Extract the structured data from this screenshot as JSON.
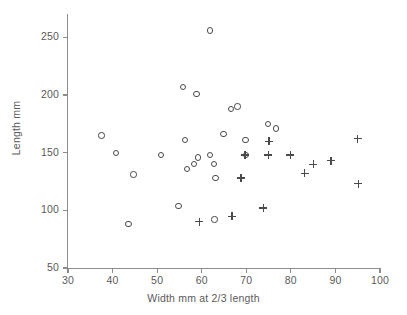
{
  "chart_data": {
    "type": "scatter",
    "title": "",
    "xlabel": "Width mm at 2/3 length",
    "ylabel": "Length mm",
    "xlim": [
      30,
      100
    ],
    "ylim": [
      50,
      270
    ],
    "xticks": [
      30,
      40,
      50,
      60,
      70,
      80,
      90,
      100
    ],
    "yticks": [
      50,
      100,
      150,
      200,
      250
    ],
    "xtick_labels": [
      "30",
      "40",
      "50",
      "60",
      "70",
      "80",
      "90",
      "100"
    ],
    "ytick_labels": [
      "50",
      "100",
      "150",
      "200",
      "250"
    ],
    "grid": false,
    "legend": false,
    "axis_color": "#8c8c8c",
    "marker_color": "#4a4a4a",
    "text_color": "#5a5a5a",
    "background": "#ffffff",
    "series": [
      {
        "name": "open-circle-group",
        "marker": "circle",
        "points": [
          {
            "x": 37.5,
            "y": 165
          },
          {
            "x": 40.7,
            "y": 150
          },
          {
            "x": 44.7,
            "y": 131
          },
          {
            "x": 43.6,
            "y": 88
          },
          {
            "x": 50.9,
            "y": 148
          },
          {
            "x": 54.8,
            "y": 104
          },
          {
            "x": 55.8,
            "y": 207
          },
          {
            "x": 56.2,
            "y": 161
          },
          {
            "x": 56.7,
            "y": 136
          },
          {
            "x": 58.3,
            "y": 140
          },
          {
            "x": 58.8,
            "y": 201
          },
          {
            "x": 59.1,
            "y": 146
          },
          {
            "x": 61.9,
            "y": 256
          },
          {
            "x": 61.8,
            "y": 148
          },
          {
            "x": 62.8,
            "y": 140
          },
          {
            "x": 62.9,
            "y": 92
          },
          {
            "x": 63.1,
            "y": 128
          },
          {
            "x": 64.9,
            "y": 166
          },
          {
            "x": 66.6,
            "y": 188
          },
          {
            "x": 68.0,
            "y": 190
          },
          {
            "x": 69.8,
            "y": 161
          },
          {
            "x": 70.0,
            "y": 148
          },
          {
            "x": 74.9,
            "y": 175
          },
          {
            "x": 76.7,
            "y": 171
          }
        ]
      },
      {
        "name": "plus-group",
        "marker": "plus",
        "points": [
          {
            "x": 59.5,
            "y": 90
          },
          {
            "x": 66.8,
            "y": 95
          },
          {
            "x": 68.8,
            "y": 128
          },
          {
            "x": 69.7,
            "y": 148
          },
          {
            "x": 73.8,
            "y": 102
          },
          {
            "x": 74.9,
            "y": 148
          },
          {
            "x": 75.1,
            "y": 160
          },
          {
            "x": 79.9,
            "y": 148
          },
          {
            "x": 83.1,
            "y": 132
          },
          {
            "x": 85.0,
            "y": 140
          },
          {
            "x": 89.0,
            "y": 143
          },
          {
            "x": 95.0,
            "y": 162
          },
          {
            "x": 95.1,
            "y": 123
          }
        ]
      }
    ]
  },
  "figure": {
    "axis_titles": {
      "x": "Width mm at 2/3 length",
      "y": "Length mm"
    }
  }
}
